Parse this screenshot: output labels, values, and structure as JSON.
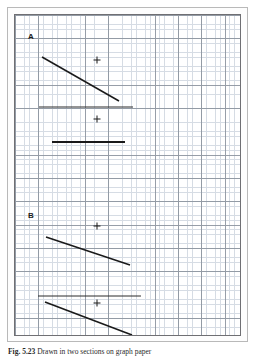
{
  "figure": {
    "panels": [
      {
        "id": "A",
        "label": "A"
      },
      {
        "id": "B",
        "label": "B"
      }
    ],
    "caption_bold": "Fig. 5.23",
    "caption_rest": "  Drawn in two sections on graph paper"
  },
  "colors": {
    "paper": "#ffffff",
    "grid_fine": "#cfd6e0",
    "grid_major": "#8c949f",
    "stroke": "#1a1a1a",
    "frame_outer": "#b9b9b9",
    "frame_inner": "#6f6f73"
  },
  "chart_data": {
    "type": "line",
    "xlabel": "",
    "ylabel": "",
    "grid": true,
    "legend": "none",
    "xlim": [
      0,
      227
    ],
    "ylim": [
      0,
      322
    ],
    "note": "Coordinates are in panel-local pixels, origin at panel top-left; y increases downward.",
    "panels": [
      {
        "name": "A",
        "label_pos": {
          "x": 13,
          "y": 22
        },
        "segments": [
          {
            "name": "A-diagonal-upper",
            "x1": 27,
            "y1": 42,
            "x2": 104,
            "y2": 86,
            "width": 1.6,
            "color": "#1a1a1a"
          },
          {
            "name": "A-horizontal-upper",
            "x1": 24,
            "y1": 92,
            "x2": 118,
            "y2": 92,
            "width": 1.0,
            "color": "#2a2a2a"
          },
          {
            "name": "A-horizontal-lower",
            "x1": 37,
            "y1": 127,
            "x2": 110,
            "y2": 127,
            "width": 2.0,
            "color": "#1a1a1a"
          }
        ],
        "markers": [
          {
            "name": "cross-upper",
            "x": 82,
            "y": 45,
            "size": 7
          },
          {
            "name": "cross-lower",
            "x": 82,
            "y": 104,
            "size": 7
          }
        ]
      },
      {
        "name": "B",
        "label_pos": {
          "x": 13,
          "y": 201
        },
        "segments": [
          {
            "name": "B-diagonal-upper",
            "x1": 31,
            "y1": 222,
            "x2": 115,
            "y2": 250,
            "width": 1.6,
            "color": "#1a1a1a"
          },
          {
            "name": "B-horizontal",
            "x1": 23,
            "y1": 281,
            "x2": 126,
            "y2": 281,
            "width": 1.0,
            "color": "#2a2a2a"
          },
          {
            "name": "B-diagonal-lower",
            "x1": 30,
            "y1": 287,
            "x2": 117,
            "y2": 320,
            "width": 1.6,
            "color": "#1a1a1a"
          }
        ],
        "markers": [
          {
            "name": "cross-upper",
            "x": 82,
            "y": 211,
            "size": 7
          },
          {
            "name": "cross-lower",
            "x": 82,
            "y": 288,
            "size": 7
          }
        ]
      }
    ]
  }
}
